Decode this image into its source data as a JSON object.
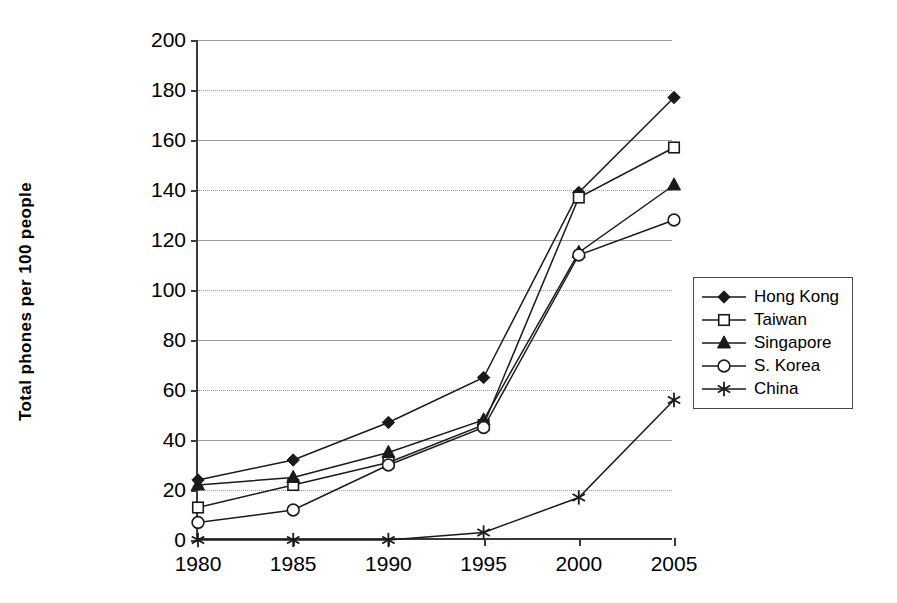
{
  "chart_data": {
    "type": "line",
    "title": "",
    "xlabel": "",
    "ylabel": "Total phones per 100 people",
    "x": [
      1980,
      1985,
      1990,
      1995,
      2000,
      2005
    ],
    "categories": [
      "1980",
      "1985",
      "1990",
      "1995",
      "2000",
      "2005"
    ],
    "xlim": [
      1980,
      2005
    ],
    "ylim": [
      0,
      200
    ],
    "ytick_step": 20,
    "yticks": [
      0,
      20,
      40,
      60,
      80,
      100,
      120,
      140,
      160,
      180,
      200
    ],
    "ytick_labels": [
      "0",
      "20",
      "40",
      "60",
      "80",
      "100",
      "120",
      "140",
      "160",
      "180",
      "200"
    ],
    "xticks": [
      1980,
      1985,
      1990,
      1995,
      2000,
      2005
    ],
    "xtick_labels": [
      "1980",
      "1985",
      "1990",
      "1995",
      "2000",
      "2005"
    ],
    "grid": true,
    "grid_axis": "y",
    "legend_position": "right",
    "series": [
      {
        "name": "Hong Kong",
        "marker": "filled-diamond",
        "values": [
          24,
          32,
          47,
          65,
          139,
          177
        ]
      },
      {
        "name": "Taiwan",
        "marker": "open-square",
        "values": [
          13,
          22,
          31,
          46,
          137,
          157
        ]
      },
      {
        "name": "Singapore",
        "marker": "filled-triangle",
        "values": [
          22,
          25,
          35,
          48,
          115,
          142
        ]
      },
      {
        "name": "S. Korea",
        "marker": "open-circle",
        "values": [
          7,
          12,
          30,
          45,
          114,
          128
        ]
      },
      {
        "name": "China",
        "marker": "asterisk",
        "values": [
          0,
          0,
          0,
          3,
          17,
          56
        ]
      }
    ]
  },
  "legend": {
    "entries": [
      {
        "label": "Hong Kong",
        "marker": "filled-diamond"
      },
      {
        "label": "Taiwan",
        "marker": "open-square"
      },
      {
        "label": "Singapore",
        "marker": "filled-triangle"
      },
      {
        "label": "S. Korea",
        "marker": "open-circle"
      },
      {
        "label": "China",
        "marker": "asterisk"
      }
    ]
  },
  "colors": {
    "line": "#1a1a1a",
    "axis": "#3a3a3a",
    "grid": "#9a9a9a",
    "background": "#ffffff"
  }
}
